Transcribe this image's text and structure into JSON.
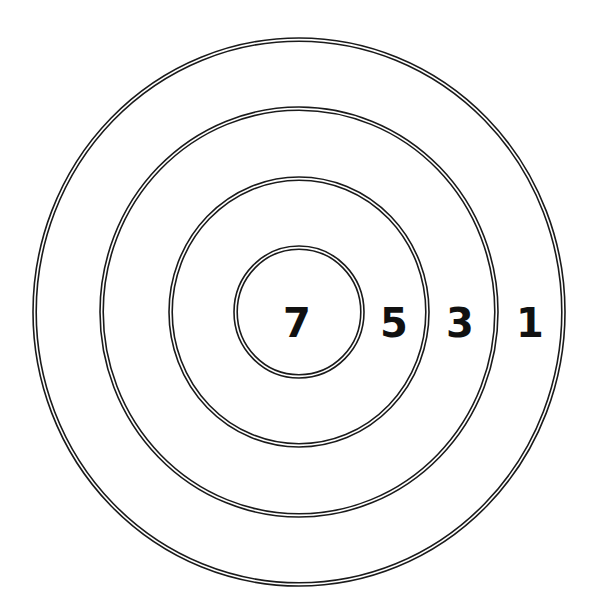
{
  "diagram": {
    "type": "target",
    "center": {
      "x": 299,
      "y": 312
    },
    "rings": [
      {
        "score": "1",
        "rx": 266,
        "ry": 274,
        "label_x": 530,
        "label_y": 323
      },
      {
        "score": "3",
        "rx": 199,
        "ry": 205,
        "label_x": 460,
        "label_y": 323
      },
      {
        "score": "5",
        "rx": 130,
        "ry": 135,
        "label_x": 394,
        "label_y": 323
      },
      {
        "score": "7",
        "rx": 65,
        "ry": 66,
        "label_x": 297,
        "label_y": 323
      }
    ],
    "colors": {
      "stroke": "#1a1a1a",
      "background": "#ffffff",
      "text": "#111111"
    }
  }
}
